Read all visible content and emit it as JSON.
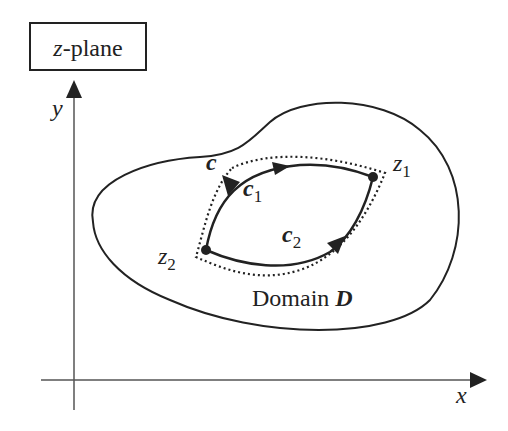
{
  "title_box": {
    "var": "z",
    "rest": "-plane"
  },
  "axes": {
    "x_label": "x",
    "y_label": "y"
  },
  "domain": {
    "label_text": "Domain ",
    "label_symbol": "D"
  },
  "contour": {
    "label": "c"
  },
  "paths": [
    {
      "label": "c",
      "sub": "1"
    },
    {
      "label": "c",
      "sub": "2"
    }
  ],
  "points": [
    {
      "label": "z",
      "sub": "1"
    },
    {
      "label": "z",
      "sub": "2"
    }
  ],
  "colors": {
    "stroke": "#222222",
    "axis": "#555555",
    "background": "#ffffff"
  }
}
